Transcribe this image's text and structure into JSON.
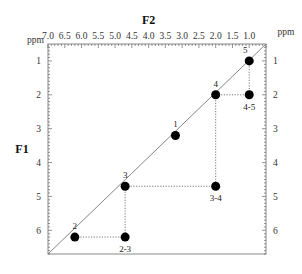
{
  "figure": {
    "type": "2D NMR COSY correlation diagram",
    "x_axis": {
      "title": "F2",
      "unit": "ppm",
      "ticks": [
        "7.0",
        "6.5",
        "6.0",
        "5.5",
        "5.0",
        "4.5",
        "4.0",
        "3.5",
        "3.0",
        "2.5",
        "2.0",
        "1.5",
        "1.0"
      ],
      "range": [
        7.0,
        0.5
      ]
    },
    "y_axis": {
      "title": "F1",
      "unit": "ppm",
      "ticks": [
        "1",
        "2",
        "3",
        "4",
        "5",
        "6"
      ],
      "range": [
        0.5,
        6.7
      ]
    },
    "diagonal_peaks": [
      {
        "label": "1",
        "f2": 3.2,
        "f1": 3.2
      },
      {
        "label": "2",
        "f2": 6.2,
        "f1": 6.2
      },
      {
        "label": "3",
        "f2": 4.7,
        "f1": 4.7
      },
      {
        "label": "4",
        "f2": 2.0,
        "f1": 2.0
      },
      {
        "label": "5",
        "f2": 1.0,
        "f1": 1.0
      }
    ],
    "cross_peaks": [
      {
        "label": "2-3",
        "f2": 4.7,
        "f1": 6.2
      },
      {
        "label": "3-4",
        "f2": 2.0,
        "f1": 4.7
      },
      {
        "label": "4-5",
        "f2": 1.0,
        "f1": 2.0
      }
    ],
    "colors": {
      "peak": "#000000",
      "diagonal": "#777777",
      "connector": "#555555",
      "frame": "#888888"
    }
  }
}
